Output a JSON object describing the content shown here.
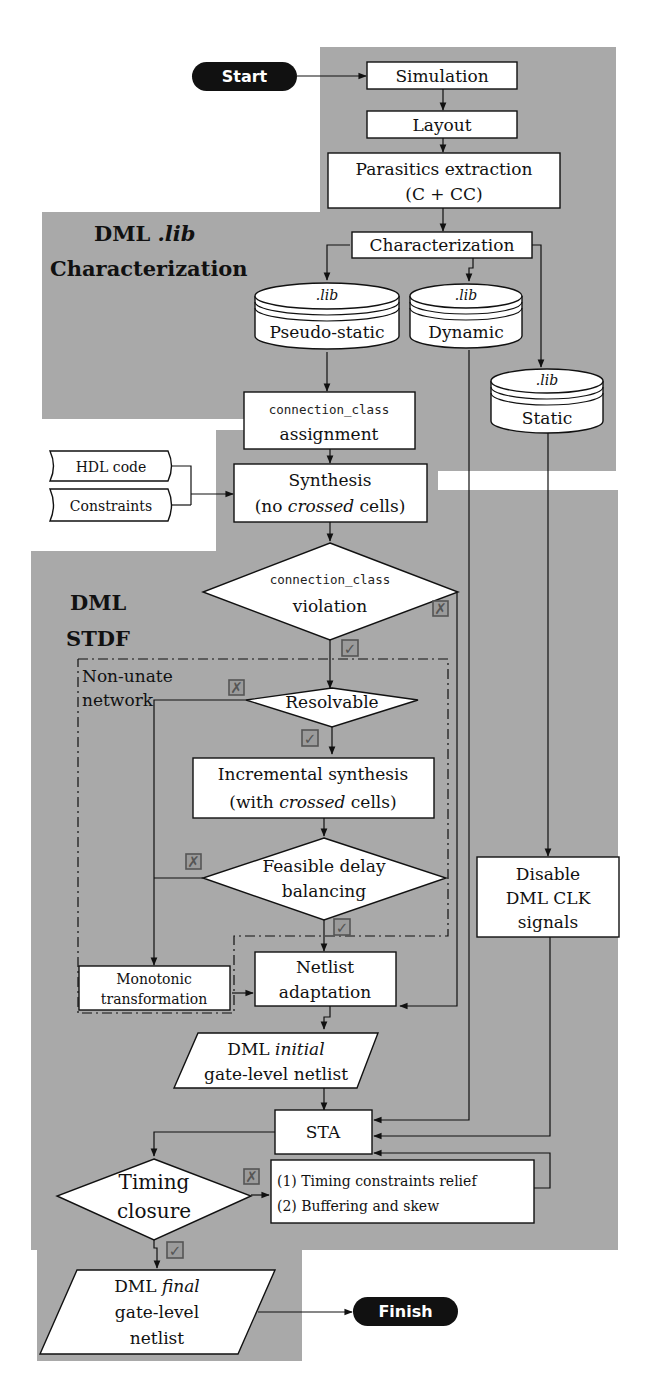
{
  "regions": {
    "characterization": {
      "title_line1": "DML",
      "title_line1_italic": ".lib",
      "title_line2": "Characterization",
      "color": "#a9a9a9"
    },
    "stdf": {
      "title_line1": "DML",
      "title_line2": "STDF",
      "color": "#a9a9a9"
    }
  },
  "terminals": {
    "start": "Start",
    "finish": "Finish"
  },
  "nodes": {
    "simulation": "Simulation",
    "layout": "Layout",
    "parasitics_line1": "Parasitics extraction",
    "parasitics_line2": "(C + CC)",
    "characterization": "Characterization",
    "lib_pseudo": {
      "tag": ".lib",
      "label": "Pseudo-static"
    },
    "lib_dynamic": {
      "tag": ".lib",
      "label": "Dynamic"
    },
    "lib_static": {
      "tag": ".lib",
      "label": "Static"
    },
    "cc_assign_line1": "connection_class",
    "cc_assign_line2": "assignment",
    "hdl_code": "HDL code",
    "constraints": "Constraints",
    "synthesis_line1": "Synthesis",
    "synthesis_line2_pre": "(no ",
    "synthesis_line2_it": "crossed",
    "synthesis_line2_post": " cells)",
    "cc_violation_line1": "connection_class",
    "cc_violation_line2": "violation",
    "non_unate_line1": "Non-unate",
    "non_unate_line2": "network",
    "resolvable": "Resolvable",
    "incr_synth_line1": "Incremental synthesis",
    "incr_synth_line2_pre": "(with ",
    "incr_synth_line2_it": "crossed",
    "incr_synth_line2_post": " cells)",
    "feasible_line1": "Feasible delay",
    "feasible_line2": "balancing",
    "monotonic_line1": "Monotonic",
    "monotonic_line2": "transformation",
    "netlist_adapt_line1": "Netlist",
    "netlist_adapt_line2": "adaptation",
    "disable_clk_line1": "Disable",
    "disable_clk_line2": "DML CLK",
    "disable_clk_line3": "signals",
    "initial_netlist_line1_pre": "DML ",
    "initial_netlist_line1_it": "initial",
    "initial_netlist_line2": "gate-level netlist",
    "sta": "STA",
    "timing_closure_line1": "Timing",
    "timing_closure_line2": "closure",
    "relief_line1": "(1) Timing constraints relief",
    "relief_line2": "(2) Buffering and skew",
    "final_netlist_line1_pre": "DML ",
    "final_netlist_line1_it": "final",
    "final_netlist_line2": "gate-level",
    "final_netlist_line3": "netlist"
  },
  "decision_marks": {
    "yes": "✓",
    "no": "✗"
  }
}
